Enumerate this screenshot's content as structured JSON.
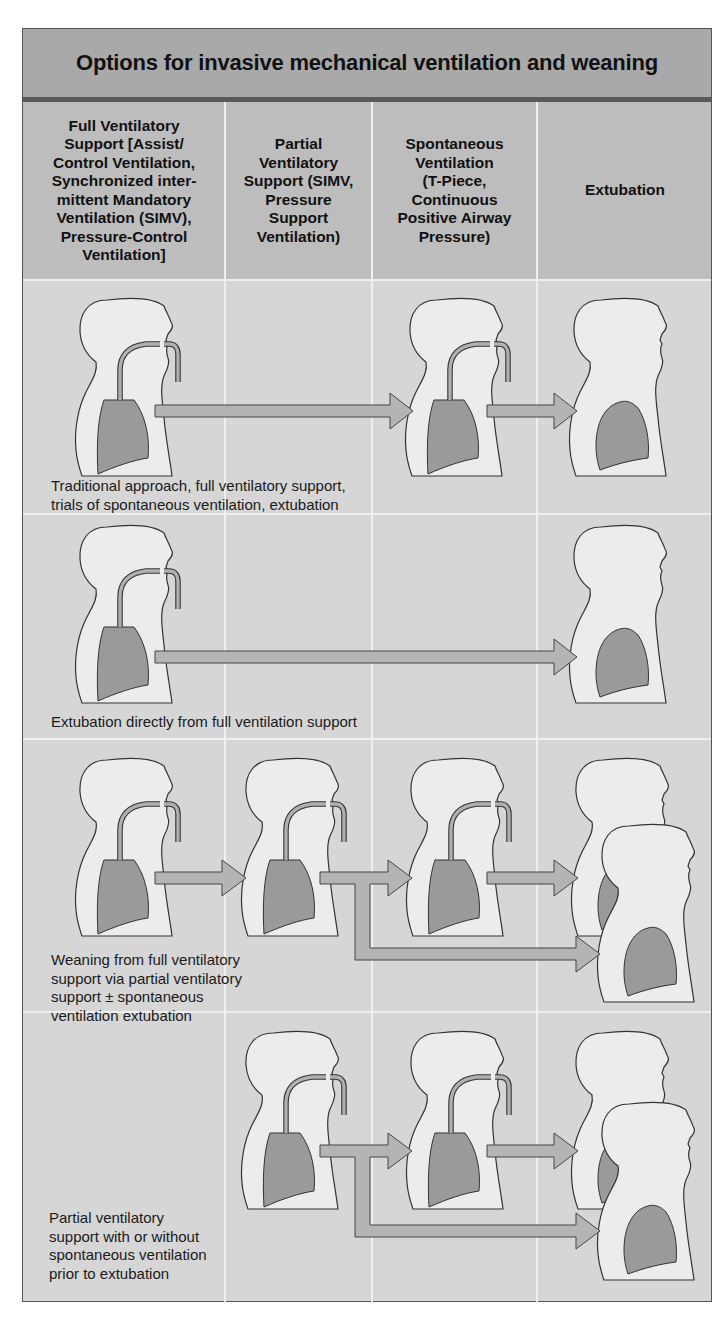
{
  "title": "Options for invasive mechanical ventilation and weaning",
  "columns": [
    {
      "id": "full",
      "label": "Full Ventilatory Support [Assist/ Control Ventilation, Synchronized inter-mittent Mandatory Ventilation (SIMV), Pressure-Control Ventilation]"
    },
    {
      "id": "partial",
      "label": "Partial Ventilatory Support (SIMV, Pressure Support Ventilation)"
    },
    {
      "id": "spontaneous",
      "label": "Spontaneous Ventilation (T-Piece, Continuous Positive Airway Pressure)"
    },
    {
      "id": "extubation",
      "label": "Extubation"
    }
  ],
  "column_lines": {
    "full": [
      "Full Ventilatory",
      "Support [Assist/",
      "Control Ventilation,",
      "Synchronized inter-",
      "mittent Mandatory",
      "Ventilation (SIMV),",
      "Pressure-Control",
      "Ventilation]"
    ],
    "partial": [
      "Partial",
      "Ventilatory",
      "Support (SIMV,",
      "Pressure",
      "Support",
      "Ventilation)"
    ],
    "spontaneous": [
      "Spontaneous",
      "Ventilation",
      "(T-Piece,",
      "Continuous",
      "Positive Airway",
      "Pressure)"
    ],
    "extubation": [
      "Extubation"
    ]
  },
  "rows": [
    {
      "id": "traditional",
      "caption_lines": [
        "Traditional approach, full ventilatory support,",
        "trials of spontaneous ventilation, extubation"
      ],
      "path": [
        "full",
        "spontaneous",
        "extubation"
      ]
    },
    {
      "id": "direct",
      "caption_lines": [
        "Extubation directly from full ventilation support"
      ],
      "path": [
        "full",
        "extubation"
      ]
    },
    {
      "id": "weaning",
      "caption_lines": [
        "Weaning from full ventilatory",
        "support via partial ventilatory",
        "support ± spontaneous",
        "ventilation extubation"
      ],
      "path": [
        "full",
        "partial",
        "spontaneous",
        "extubation"
      ],
      "branch": "partial→extubation"
    },
    {
      "id": "partial_only",
      "caption_lines": [
        "Partial ventilatory",
        "support with or without",
        "spontaneous ventilation",
        "prior to extubation"
      ],
      "path": [
        "partial",
        "spontaneous",
        "extubation"
      ],
      "branch": "partial→extubation"
    }
  ],
  "colors": {
    "title_band": "#a9a9a9",
    "header_row": "#bdbdbd",
    "body_bg": "#d6d6d6",
    "grid_lines": "#efefef",
    "figure_fill": "#ececec",
    "lung_fill": "#9a9a9a",
    "arrow_fill": "#b4b4b4",
    "outline": "#333333"
  }
}
